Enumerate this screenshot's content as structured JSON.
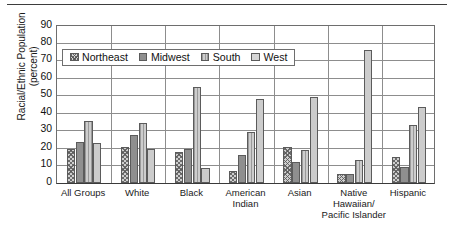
{
  "chart_data": {
    "type": "bar",
    "title": "",
    "xlabel": "",
    "ylabel": "Racial/Ethnic Population (percent)",
    "ylabel_line1": "Racial/Ethnic Population",
    "ylabel_line2": "(percent)",
    "ylim": [
      0,
      90
    ],
    "ytick_labels": [
      "90",
      "80",
      "70",
      "60",
      "50",
      "40",
      "30",
      "20",
      "10",
      "0"
    ],
    "ytick_values": [
      90,
      80,
      70,
      60,
      50,
      40,
      30,
      20,
      10,
      0
    ],
    "grid": true,
    "legend_position": "upper-left-inside",
    "categories": [
      "All Groups",
      "White",
      "Black",
      "American Indian",
      "Asian",
      "Native Hawaiian/ Pacific Islander",
      "Hispanic"
    ],
    "category_lines": [
      [
        "All Groups"
      ],
      [
        "White"
      ],
      [
        "Black"
      ],
      [
        "American",
        "Indian"
      ],
      [
        "Asian"
      ],
      [
        "Native",
        "Hawaiian/",
        "Pacific Islander"
      ],
      [
        "Hispanic"
      ]
    ],
    "series": [
      {
        "name": "Northeast",
        "pattern": "crosshatch",
        "color": "#cfcfcf",
        "values": [
          19,
          20.5,
          17.5,
          6.5,
          20.5,
          5,
          14.5
        ]
      },
      {
        "name": "Midwest",
        "pattern": "solid-dark",
        "color": "#8f8f8f",
        "values": [
          23,
          27,
          19,
          16,
          12,
          5,
          9
        ]
      },
      {
        "name": "South",
        "pattern": "vertical-stripes",
        "color": "#c2c2c2",
        "values": [
          35.5,
          34,
          55,
          29,
          18.5,
          13,
          33
        ]
      },
      {
        "name": "West",
        "pattern": "solid-light",
        "color": "#cccccc",
        "values": [
          22.5,
          19,
          8.5,
          48,
          49,
          76,
          43.5
        ]
      }
    ]
  },
  "legend": {
    "items": [
      {
        "label": "Northeast"
      },
      {
        "label": "Midwest"
      },
      {
        "label": "South"
      },
      {
        "label": "West"
      }
    ]
  }
}
